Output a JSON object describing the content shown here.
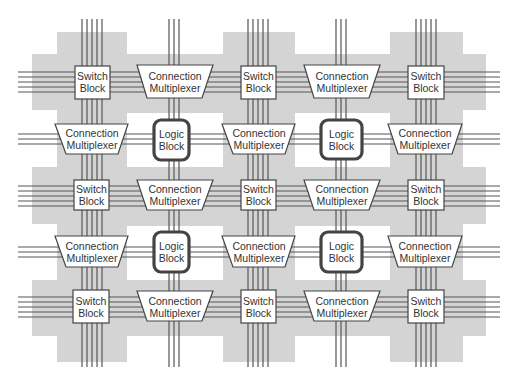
{
  "diagram": {
    "colors": {
      "background": "#ffffff",
      "routing_region": "#d4d4d4",
      "wire": "#555555",
      "block_stroke": "#444444",
      "text": "#333333"
    },
    "labels": {
      "switch_block": [
        "Switch",
        "Block"
      ],
      "connection_multiplexer": [
        "Connection",
        "Multiplexer"
      ],
      "logic_block": [
        "Logic",
        "Block"
      ]
    },
    "grid": {
      "rows": [
        [
          "Switch Block",
          "Connection Multiplexer",
          "Switch Block",
          "Connection Multiplexer",
          "Switch Block"
        ],
        [
          "Connection Multiplexer",
          "Logic Block",
          "Connection Multiplexer",
          "Logic Block",
          "Connection Multiplexer"
        ],
        [
          "Switch Block",
          "Connection Multiplexer",
          "Switch Block",
          "Connection Multiplexer",
          "Switch Block"
        ],
        [
          "Connection Multiplexer",
          "Logic Block",
          "Connection Multiplexer",
          "Logic Block",
          "Connection Multiplexer"
        ],
        [
          "Switch Block",
          "Connection Multiplexer",
          "Switch Block",
          "Connection Multiplexer",
          "Switch Block"
        ]
      ]
    },
    "blocks": [
      {
        "type": "switch",
        "l1": "Switch",
        "l2": "Block"
      },
      {
        "type": "mux",
        "l1": "Connection",
        "l2": "Multiplexer"
      },
      {
        "type": "switch",
        "l1": "Switch",
        "l2": "Block"
      },
      {
        "type": "mux",
        "l1": "Connection",
        "l2": "Multiplexer"
      },
      {
        "type": "switch",
        "l1": "Switch",
        "l2": "Block"
      },
      {
        "type": "mux",
        "l1": "Connection",
        "l2": "Multiplexer"
      },
      {
        "type": "logic",
        "l1": "Logic",
        "l2": "Block"
      },
      {
        "type": "mux",
        "l1": "Connection",
        "l2": "Multiplexer"
      },
      {
        "type": "logic",
        "l1": "Logic",
        "l2": "Block"
      },
      {
        "type": "mux",
        "l1": "Connection",
        "l2": "Multiplexer"
      },
      {
        "type": "switch",
        "l1": "Switch",
        "l2": "Block"
      },
      {
        "type": "mux",
        "l1": "Connection",
        "l2": "Multiplexer"
      },
      {
        "type": "switch",
        "l1": "Switch",
        "l2": "Block"
      },
      {
        "type": "mux",
        "l1": "Connection",
        "l2": "Multiplexer"
      },
      {
        "type": "switch",
        "l1": "Switch",
        "l2": "Block"
      },
      {
        "type": "mux",
        "l1": "Connection",
        "l2": "Multiplexer"
      },
      {
        "type": "logic",
        "l1": "Logic",
        "l2": "Block"
      },
      {
        "type": "mux",
        "l1": "Connection",
        "l2": "Multiplexer"
      },
      {
        "type": "logic",
        "l1": "Logic",
        "l2": "Block"
      },
      {
        "type": "mux",
        "l1": "Connection",
        "l2": "Multiplexer"
      },
      {
        "type": "switch",
        "l1": "Switch",
        "l2": "Block"
      },
      {
        "type": "mux",
        "l1": "Connection",
        "l2": "Multiplexer"
      },
      {
        "type": "switch",
        "l1": "Switch",
        "l2": "Block"
      },
      {
        "type": "mux",
        "l1": "Connection",
        "l2": "Multiplexer"
      },
      {
        "type": "switch",
        "l1": "Switch",
        "l2": "Block"
      }
    ],
    "wires": {
      "switch_channel_tracks": 5,
      "logic_channel_tracks": 3
    }
  }
}
